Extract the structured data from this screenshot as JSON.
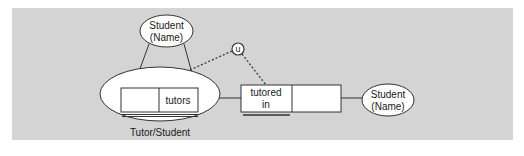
{
  "diagram": {
    "type": "ER / object-relational diagram",
    "background_color": "#d4d4d4",
    "nodes": {
      "top_entity": {
        "line1": "Student",
        "line2": "(Name)"
      },
      "unique_marker": {
        "label": "u"
      },
      "composite_entity": {
        "label": "Tutor/Student",
        "cell_right": "tutors",
        "cell_left": ""
      },
      "relation_box": {
        "line1": "tutored",
        "line2": "in",
        "cell_right": ""
      },
      "right_entity": {
        "line1": "Student",
        "line2": "(Name)"
      }
    },
    "edges": [
      {
        "from": "top_entity",
        "to": "composite_entity.cell_left",
        "style": "solid"
      },
      {
        "from": "top_entity",
        "to": "composite_entity.cell_right",
        "style": "solid"
      },
      {
        "from": "composite_entity.cell_left",
        "to": "unique_marker",
        "style": "dotted"
      },
      {
        "from": "unique_marker",
        "to": "relation_box",
        "style": "dotted"
      },
      {
        "from": "composite_entity.cell_right",
        "to": "relation_box",
        "style": "solid"
      },
      {
        "from": "relation_box",
        "to": "right_entity",
        "style": "solid"
      }
    ]
  }
}
